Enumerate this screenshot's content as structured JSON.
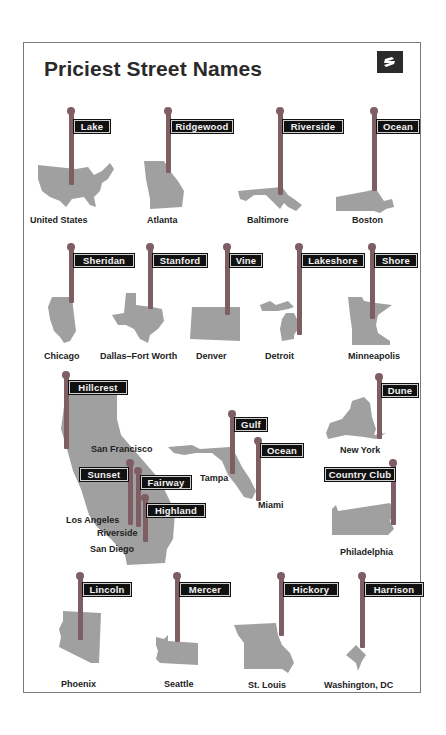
{
  "title": "Priciest Street Names",
  "logo": {
    "icon": "zillow-z-logo-icon",
    "bg_color": "#2b2b2b"
  },
  "colors": {
    "pole": "#7e5e63",
    "sign_bg": "#111111",
    "sign_text": "#f2f2f2",
    "map_fill": "#a0a0a0",
    "border": "#7a7a7a"
  },
  "items": [
    {
      "city": "United States",
      "street": "Lake"
    },
    {
      "city": "Atlanta",
      "street": "Ridgewood"
    },
    {
      "city": "Baltimore",
      "street": "Riverside"
    },
    {
      "city": "Boston",
      "street": "Ocean"
    },
    {
      "city": "Chicago",
      "street": "Sheridan"
    },
    {
      "city": "Dallas–Fort Worth",
      "street": "Stanford"
    },
    {
      "city": "Denver",
      "street": "Vine"
    },
    {
      "city": "Detroit",
      "street": "Lakeshore"
    },
    {
      "city": "Minneapolis",
      "street": "Shore"
    },
    {
      "city": "San Francisco",
      "street": "Hillcrest"
    },
    {
      "city": "Los Angeles",
      "street": "Sunset"
    },
    {
      "city": "Riverside",
      "street": "Fairway"
    },
    {
      "city": "San Diego",
      "street": "Highland"
    },
    {
      "city": "Tampa",
      "street": "Gulf"
    },
    {
      "city": "Miami",
      "street": "Ocean"
    },
    {
      "city": "New York",
      "street": "Dune"
    },
    {
      "city": "Philadelphia",
      "street": "Country Club"
    },
    {
      "city": "Phoenix",
      "street": "Lincoln"
    },
    {
      "city": "Seattle",
      "street": "Mercer"
    },
    {
      "city": "St. Louis",
      "street": "Hickory"
    },
    {
      "city": "Washington, DC",
      "street": "Harrison"
    }
  ]
}
